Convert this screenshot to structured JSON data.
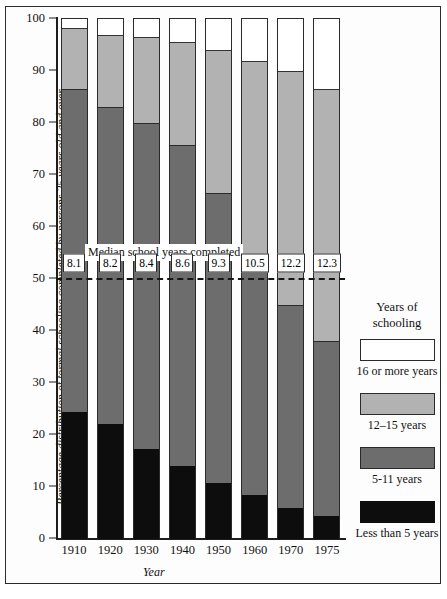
{
  "chart_data": {
    "type": "bar",
    "subtype": "stacked-100-percent",
    "title": "",
    "xlabel": "Year",
    "ylabel": "Percentage distribution of formal schooling completed by persons 25 years old and over",
    "ylim": [
      0,
      100
    ],
    "yticks": [
      0,
      10,
      20,
      30,
      40,
      50,
      60,
      70,
      80,
      90,
      100
    ],
    "ytick_labels": [
      "0",
      "10",
      "20",
      "30",
      "40",
      "50",
      "60",
      "70",
      "80",
      "90",
      "100"
    ],
    "grid": false,
    "legend_position": "right",
    "categories": [
      "1910",
      "1920",
      "1930",
      "1940",
      "1950",
      "1960",
      "1970",
      "1975"
    ],
    "series": [
      {
        "name": "Less than 5 years",
        "color": "#0d0d0d",
        "values": [
          24.5,
          22.2,
          17.3,
          14.0,
          10.8,
          8.5,
          6.0,
          4.5
        ]
      },
      {
        "name": "5-11 years",
        "color": "#6d6d6d",
        "values": [
          62.0,
          60.8,
          62.7,
          61.8,
          55.7,
          44.5,
          39.0,
          33.5
        ]
      },
      {
        "name": "12-15 years",
        "color": "#b2b2b2",
        "values": [
          11.8,
          14.0,
          16.5,
          19.7,
          27.5,
          39.0,
          45.0,
          48.5
        ]
      },
      {
        "name": "16 or more years",
        "color": "#ffffff",
        "values": [
          1.7,
          3.0,
          3.5,
          4.5,
          6.0,
          8.0,
          10.0,
          13.5
        ]
      }
    ],
    "cumulative_tops": {
      "black": [
        24.5,
        22.2,
        17.3,
        14.0,
        10.8,
        8.5,
        6.0,
        4.5
      ],
      "dark_gray": [
        86.5,
        83.0,
        80.0,
        75.8,
        66.5,
        53.0,
        45.0,
        38.0
      ],
      "light_gray": [
        98.3,
        97.0,
        96.5,
        95.5,
        94.0,
        92.0,
        90.0,
        86.5
      ],
      "white": [
        100,
        100,
        100,
        100,
        100,
        100,
        100,
        100
      ]
    },
    "annotations": {
      "median_caption": "Median school years completed",
      "median_reference_value": 50,
      "median_values": [
        "8.1",
        "8.2",
        "8.4",
        "8.6",
        "9.3",
        "10.5",
        "12.2",
        "12.3"
      ]
    }
  },
  "legend": {
    "title_line1": "Years of",
    "title_line2": "schooling",
    "items": [
      {
        "label": "16 or more years",
        "swatch": "w"
      },
      {
        "label": "12–15 years",
        "swatch": "lg"
      },
      {
        "label": "5-11 years",
        "swatch": "dg"
      },
      {
        "label": "Less than 5 years",
        "swatch": "bk"
      }
    ]
  }
}
